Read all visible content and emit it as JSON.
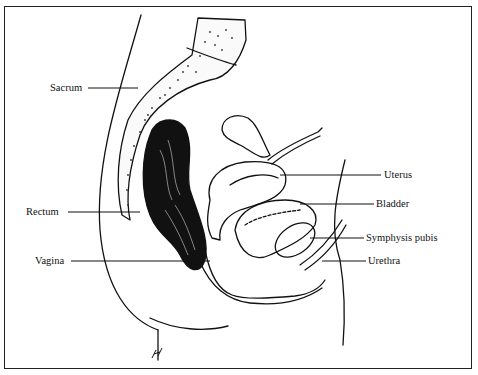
{
  "figure": {
    "labels_left": [
      {
        "id": "sacrum",
        "text": "Sacrum"
      },
      {
        "id": "rectum",
        "text": "Rectum"
      },
      {
        "id": "vagina",
        "text": "Vagina"
      }
    ],
    "labels_right": [
      {
        "id": "uterus",
        "text": "Uterus"
      },
      {
        "id": "bladder",
        "text": "Bladder"
      },
      {
        "id": "symphysis",
        "text": "Symphysis pubis"
      },
      {
        "id": "urethra",
        "text": "Urethra"
      }
    ],
    "signature": "H",
    "colors": {
      "ink": "#111111",
      "background": "#ffffff"
    }
  }
}
